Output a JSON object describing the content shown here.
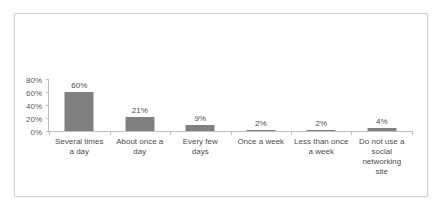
{
  "chart_data": {
    "type": "bar",
    "title": "",
    "subtitle": "",
    "xlabel": "",
    "ylabel": "",
    "categories": [
      "Several times a day",
      "About once a day",
      "Every few days",
      "Once a week",
      "Less than once a week",
      "Do not use a social networking site"
    ],
    "category_labels_wrapped": [
      "Several times\na day",
      "About once a\nday",
      "Every few\ndays",
      "Once a week",
      "Less than once\na week",
      "Do not use a\nsocial\nnetworking\nsite"
    ],
    "values": [
      60,
      21,
      9,
      2,
      2,
      4
    ],
    "data_labels": [
      "60%",
      "21%",
      "9%",
      "2%",
      "2%",
      "4%"
    ],
    "ylim": [
      0,
      80
    ],
    "yticks": [
      0,
      20,
      40,
      60,
      80
    ],
    "ytick_labels": [
      "0%",
      "20%",
      "40%",
      "60%",
      "80%"
    ],
    "grid": false,
    "legend": false,
    "legend_position": "none",
    "bar_color": "#808080",
    "axis_color": "#bfbfbf",
    "text_color": "#4d4d4d",
    "border_color": "#d2d2d2",
    "background": "#ffffff"
  }
}
